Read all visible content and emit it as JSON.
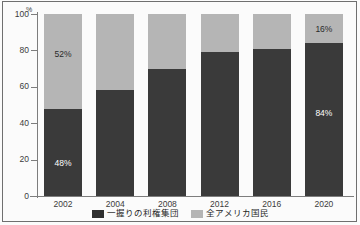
{
  "chart_data": {
    "type": "bar",
    "subtype": "100-percent-stacked-bar",
    "title": "",
    "subtitle": "",
    "xlabel": "",
    "ylabel": "",
    "yunit": "%",
    "ylim": [
      0,
      100
    ],
    "yticks": [
      0,
      20,
      40,
      60,
      80,
      100
    ],
    "ytick_labels": [
      "0",
      "20",
      "40",
      "60",
      "80",
      "100"
    ],
    "grid": false,
    "legend_position": "bottom-center",
    "categories": [
      "2002",
      "2004",
      "2008",
      "2012",
      "2016",
      "2020"
    ],
    "series": [
      {
        "name": "一握りの利権集団",
        "color": "#3a3a3a",
        "values": [
          48,
          58,
          70,
          79,
          81,
          84
        ],
        "data_labels": [
          "48%",
          "",
          "",
          "",
          "",
          "84%"
        ]
      },
      {
        "name": "全アメリカ国民",
        "color": "#b5b5b5",
        "values": [
          52,
          42,
          30,
          21,
          19,
          16
        ],
        "data_labels": [
          "52%",
          "",
          "",
          "",
          "",
          "16%"
        ]
      }
    ],
    "annotations": []
  },
  "axis": {
    "y_unit_label": "%",
    "ticks": [
      {
        "value": 100,
        "label": "100"
      },
      {
        "value": 80,
        "label": "80"
      },
      {
        "value": 60,
        "label": "60"
      },
      {
        "value": 40,
        "label": "40"
      },
      {
        "value": 20,
        "label": "20"
      },
      {
        "value": 0,
        "label": "0"
      }
    ]
  },
  "bars": [
    {
      "category": "2002",
      "lower_value": 48,
      "upper_value": 52,
      "lower_label": "48%",
      "upper_label": "52%"
    },
    {
      "category": "2004",
      "lower_value": 58,
      "upper_value": 42,
      "lower_label": "",
      "upper_label": ""
    },
    {
      "category": "2008",
      "lower_value": 70,
      "upper_value": 30,
      "lower_label": "",
      "upper_label": ""
    },
    {
      "category": "2012",
      "lower_value": 79,
      "upper_value": 21,
      "lower_label": "",
      "upper_label": ""
    },
    {
      "category": "2016",
      "lower_value": 81,
      "upper_value": 19,
      "lower_label": "",
      "upper_label": ""
    },
    {
      "category": "2020",
      "lower_value": 84,
      "upper_value": 16,
      "lower_label": "84%",
      "upper_label": "16%"
    }
  ],
  "legend": {
    "items": [
      {
        "label": "一握りの利権集団",
        "swatch": "lower"
      },
      {
        "label": "全アメリカ国民",
        "swatch": "upper"
      }
    ]
  },
  "colors": {
    "lower_series": "#3a3a3a",
    "upper_series": "#b5b5b5",
    "axis": "#7d7d7d",
    "text": "#3b3b3b",
    "frame": "#6f6f6f",
    "background": "#fbfbfb"
  }
}
